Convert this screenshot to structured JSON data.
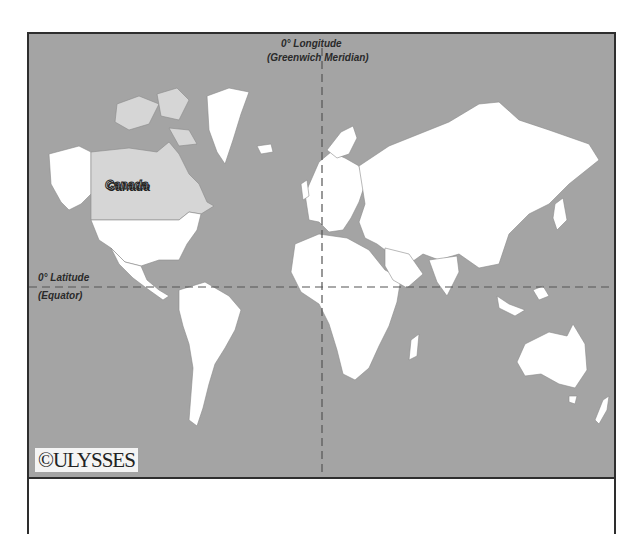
{
  "map": {
    "title": "World map highlighting Canada",
    "labels": {
      "longitude_line1": "0° Longitude",
      "longitude_line2": "(Greenwich Meridian)",
      "latitude_line1": "0° Latitude",
      "latitude_line2": "(Equator)",
      "highlight_country": "Canada"
    },
    "copyright": "©ULYSSES",
    "colors": {
      "ocean": "#a4a4a4",
      "land": "#ffffff",
      "highlight": "#d6d6d6",
      "border": "#2e2e2e"
    }
  }
}
